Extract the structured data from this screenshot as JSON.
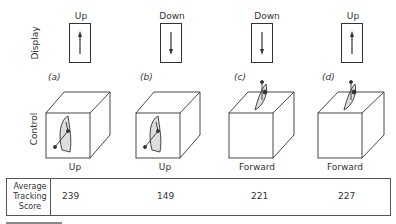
{
  "row_labels": {
    "display": "Display",
    "control": "Control"
  },
  "panels": [
    {
      "id": "a",
      "label": "(a)",
      "display": "Up",
      "display_arrow": "up",
      "control": "Up",
      "control_type": "side-lever",
      "score": "239"
    },
    {
      "id": "b",
      "label": "(b)",
      "display": "Down",
      "display_arrow": "down",
      "control": "Up",
      "control_type": "side-lever",
      "score": "149"
    },
    {
      "id": "c",
      "label": "(c)",
      "display": "Down",
      "display_arrow": "down",
      "control": "Forward",
      "control_type": "top-lever",
      "score": "221"
    },
    {
      "id": "d",
      "label": "(d)",
      "display": "Up",
      "display_arrow": "up",
      "control": "Forward",
      "control_type": "top-lever",
      "score": "227"
    }
  ],
  "table": {
    "header_lines": [
      "Average",
      "Tracking",
      "Score"
    ]
  },
  "colors": {
    "line": "#333333",
    "lever_fill": "#dddddd"
  }
}
